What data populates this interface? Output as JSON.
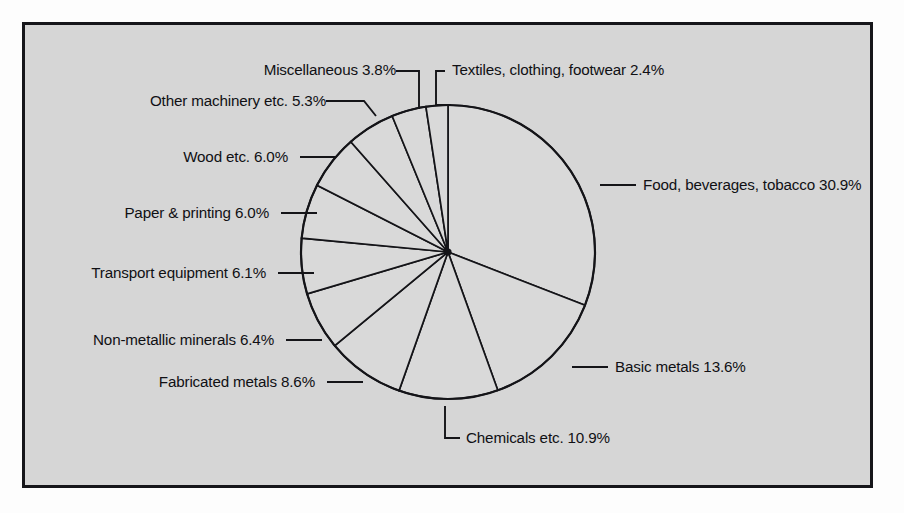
{
  "figure": {
    "background_color": "#fdfdfd",
    "panel_color": "#d6d6d6",
    "border_color": "#16161a",
    "slice_fill": "#d9d9d9",
    "line_color": "#141418",
    "text_color": "#101014"
  },
  "chart_data": {
    "type": "pie",
    "title": "",
    "subtitle": "",
    "xlabel": "",
    "ylabel": "",
    "legend_position": "callout-labels",
    "grid": false,
    "units": "percent",
    "start_angle_deg": 0,
    "direction": "clockwise",
    "categories": [
      "Food, beverages, tobacco",
      "Basic metals",
      "Chemicals etc.",
      "Fabricated metals",
      "Non-metallic minerals",
      "Transport equipment",
      "Paper & printing",
      "Wood etc.",
      "Other machinery etc.",
      "Miscellaneous",
      "Textiles, clothing, footwear"
    ],
    "values": [
      30.9,
      13.6,
      10.9,
      8.6,
      6.4,
      6.1,
      6.0,
      6.0,
      5.3,
      3.8,
      2.4
    ],
    "total": 100.0
  },
  "labels": {
    "food": "Food, beverages, tobacco 30.9%",
    "basic_metals": "Basic metals 13.6%",
    "chemicals": "Chemicals etc. 10.9%",
    "fabricated_metals": "Fabricated metals 8.6%",
    "non_metallic": "Non-metallic minerals 6.4%",
    "transport": "Transport equipment 6.1%",
    "paper": "Paper & printing 6.0%",
    "wood": "Wood etc. 6.0%",
    "other_machinery": "Other machinery etc. 5.3%",
    "miscellaneous": "Miscellaneous 3.8%",
    "textiles": "Textiles, clothing, footwear 2.4%"
  }
}
